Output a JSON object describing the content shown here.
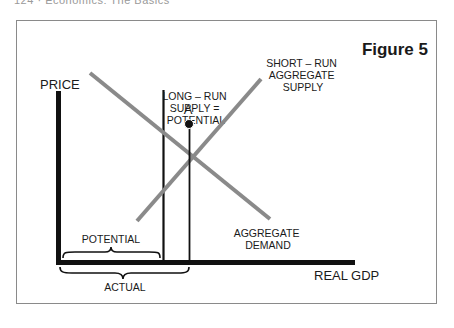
{
  "page": {
    "running_head": "124 · Economics: The Basics"
  },
  "figure": {
    "title": "Figure 5",
    "y_axis_label": "PRICE",
    "x_axis_label": "REAL GDP",
    "curves": {
      "long_run_supply": [
        "LONG – RUN",
        "SUPPLY =",
        "POTENTIAL"
      ],
      "short_run_supply": [
        "SHORT – RUN",
        "AGGREGATE",
        "SUPPLY"
      ],
      "aggregate_demand": [
        "AGGREGATE",
        "DEMAND"
      ]
    },
    "point_label": "A",
    "braces": {
      "potential": "POTENTIAL",
      "actual": "ACTUAL"
    },
    "colors": {
      "axis": "#111111",
      "curve": "#8a8a8a",
      "frame": "#8a8a8a"
    }
  }
}
